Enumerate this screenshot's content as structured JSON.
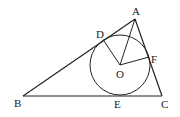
{
  "diagram": {
    "type": "geometry",
    "points": {
      "A": {
        "label": "A",
        "x": 135,
        "y": 19
      },
      "B": {
        "label": "B",
        "x": 23,
        "y": 96
      },
      "C": {
        "label": "C",
        "x": 162,
        "y": 96
      },
      "O": {
        "label": "O",
        "x": 120,
        "y": 65
      },
      "D": {
        "label": "D",
        "x": 104,
        "y": 41
      },
      "E": {
        "label": "E",
        "x": 120,
        "y": 96
      },
      "F": {
        "label": "F",
        "x": 149,
        "y": 57
      }
    },
    "circle": {
      "center": "O",
      "radius": 30
    },
    "segments": [
      [
        "A",
        "B"
      ],
      [
        "B",
        "C"
      ],
      [
        "C",
        "A"
      ],
      [
        "O",
        "A"
      ],
      [
        "O",
        "D"
      ],
      [
        "O",
        "F"
      ]
    ],
    "labels": {
      "A": "A",
      "B": "B",
      "C": "C",
      "D": "D",
      "E": "E",
      "F": "F",
      "O": "O"
    },
    "stroke_color": "#222222"
  }
}
